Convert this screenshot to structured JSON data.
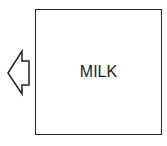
{
  "diagram": {
    "box": {
      "label": "MILK"
    },
    "arrow": {
      "direction": "left",
      "icon": "left-arrow-icon"
    },
    "colors": {
      "stroke": "#222222",
      "background": "#ffffff"
    }
  }
}
